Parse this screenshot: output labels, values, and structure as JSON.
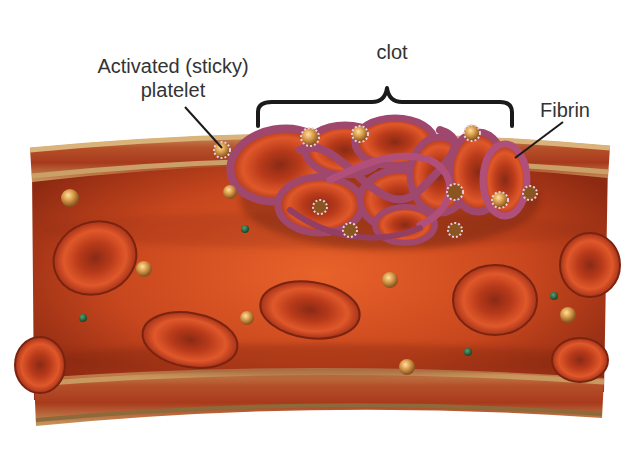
{
  "diagram": {
    "labels": {
      "platelet_line1": "Activated (sticky)",
      "platelet_line2": "platelet",
      "clot": "clot",
      "fibrin": "Fibrin"
    },
    "components": [
      "blood vessel wall",
      "red blood cells",
      "platelets",
      "white blood cells",
      "fibrin strands",
      "clot"
    ],
    "colors": {
      "vessel_lumen": "#c9471e",
      "vessel_wall_outer": "#b88a52",
      "vessel_wall_band": "#a8391a",
      "red_blood_cell": "#d94a1f",
      "fibrin": "#a0476d",
      "platelet": "#d99a4a",
      "white_cell": "#2a6b40",
      "text": "#333333",
      "leader_line": "#1a1a1a"
    }
  }
}
